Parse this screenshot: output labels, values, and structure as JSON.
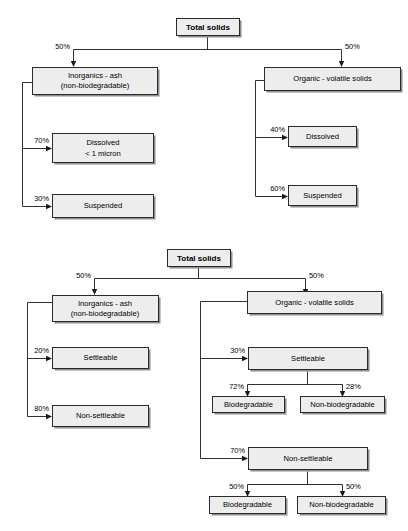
{
  "document": {
    "title": "Total solids composition flowcharts",
    "background_color": "#ffffff",
    "box_fill_color": "#ededed",
    "box_border_color": "#2b2b2b",
    "shadow_color": "#8d8d8d",
    "line_color": "#1a1a1a"
  },
  "diagrams": [
    {
      "id": "diagram-top",
      "name": "total-solids-dissolved-suspended",
      "root": {
        "label": "Total solids",
        "bold": true
      },
      "branches": [
        {
          "name": "inorganics-branch",
          "percent": "50%",
          "label_line1": "Inorganics - ash",
          "label_line2": "(non-biodegradable)",
          "children": [
            {
              "percent": "70%",
              "label_line1": "Dissolved",
              "label_line2": "< 1 micron"
            },
            {
              "percent": "30%",
              "label_line1": "Suspended",
              "label_line2": ""
            }
          ]
        },
        {
          "name": "organic-branch",
          "percent": "50%",
          "label_line1": "Organic - volatile solids",
          "label_line2": "",
          "children": [
            {
              "percent": "40%",
              "label_line1": "Dissolved",
              "label_line2": ""
            },
            {
              "percent": "60%",
              "label_line1": "Suspended",
              "label_line2": ""
            }
          ]
        }
      ]
    },
    {
      "id": "diagram-bottom",
      "name": "total-solids-settleable-biodegradable",
      "root": {
        "label": "Total solids",
        "bold": true
      },
      "branches": [
        {
          "name": "inorganics-branch",
          "percent": "50%",
          "label_line1": "Inorganics - ash",
          "label_line2": "(non-biodegradable)",
          "children": [
            {
              "percent": "20%",
              "label_line1": "Settleable",
              "label_line2": ""
            },
            {
              "percent": "80%",
              "label_line1": "Non-settleable",
              "label_line2": ""
            }
          ]
        },
        {
          "name": "organic-branch",
          "percent": "50%",
          "label_line1": "Organic - volatile solids",
          "label_line2": "",
          "children": [
            {
              "percent": "30%",
              "label_line1": "Settleable",
              "label_line2": "",
              "children": [
                {
                  "percent": "72%",
                  "label_line1": "Biodegradable",
                  "label_line2": ""
                },
                {
                  "percent": "28%",
                  "label_line1": "Non-biodegradable",
                  "label_line2": ""
                }
              ]
            },
            {
              "percent": "70%",
              "label_line1": "Non-settleable",
              "label_line2": "",
              "children": [
                {
                  "percent": "50%",
                  "label_line1": "Biodegradable",
                  "label_line2": ""
                },
                {
                  "percent": "50%",
                  "label_line1": "Non-biodegradable",
                  "label_line2": ""
                }
              ]
            }
          ]
        }
      ]
    }
  ],
  "nodes": {
    "t_root": "Total solids",
    "t_inorg_1": "Inorganics - ash",
    "t_inorg_2": "(non-biodegradable)",
    "t_org": "Organic - volatile solids",
    "t_dis_l_1": "Dissolved",
    "t_dis_l_2": "< 1 micron",
    "t_sus_l": "Suspended",
    "t_dis_r": "Dissolved",
    "t_sus_r": "Suspended",
    "b_root": "Total solids",
    "b_inorg_1": "Inorganics - ash",
    "b_inorg_2": "(non-biodegradable)",
    "b_org": "Organic - volatile solids",
    "b_set_l": "Settleable",
    "b_nonset_l": "Non-settleable",
    "b_set_r": "Settleable",
    "b_nonset_r": "Non-settleable",
    "b_bio_1": "Biodegradable",
    "b_nonbio_1": "Non-biodegradable",
    "b_bio_2": "Biodegradable",
    "b_nonbio_2": "Non-biodegradable"
  },
  "percents": {
    "t_left": "50%",
    "t_right": "50%",
    "t_dis_l": "70%",
    "t_sus_l": "30%",
    "t_dis_r": "40%",
    "t_sus_r": "60%",
    "b_left": "50%",
    "b_right": "50%",
    "b_set_l": "20%",
    "b_nonset_l": "80%",
    "b_set_r": "30%",
    "b_nonset_r": "70%",
    "b_bio_1": "72%",
    "b_nonbio_1": "28%",
    "b_bio_2": "50%",
    "b_nonbio_2": "50%"
  }
}
